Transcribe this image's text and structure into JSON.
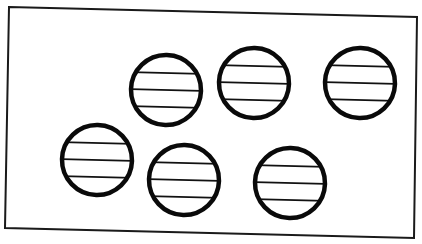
{
  "diagram": {
    "frame": {
      "corners": [
        [
          9,
          7
        ],
        [
          417,
          17
        ],
        [
          414,
          238
        ],
        [
          5,
          228
        ]
      ],
      "stroke": "#1a1a1a",
      "stroke_width": 2
    },
    "circle_style": {
      "stroke": "#0a0a0a",
      "stroke_width": 4.5,
      "line_stroke": "#111111",
      "line_width": 1.6,
      "fill": "#ffffff",
      "radius": 35
    },
    "circles": [
      {
        "id": "circle-1",
        "cx": 166,
        "cy": 90,
        "r": 35,
        "stripes": 3
      },
      {
        "id": "circle-2",
        "cx": 254,
        "cy": 83,
        "r": 35,
        "stripes": 3
      },
      {
        "id": "circle-3",
        "cx": 360,
        "cy": 83,
        "r": 35,
        "stripes": 3
      },
      {
        "id": "circle-4",
        "cx": 97,
        "cy": 160,
        "r": 35,
        "stripes": 3
      },
      {
        "id": "circle-5",
        "cx": 184,
        "cy": 180,
        "r": 35,
        "stripes": 3
      },
      {
        "id": "circle-6",
        "cx": 290,
        "cy": 183,
        "r": 35,
        "stripes": 3
      }
    ],
    "stripe_offsets": [
      -17,
      0,
      17
    ],
    "rotation_deg": 1.4,
    "count": 6
  }
}
